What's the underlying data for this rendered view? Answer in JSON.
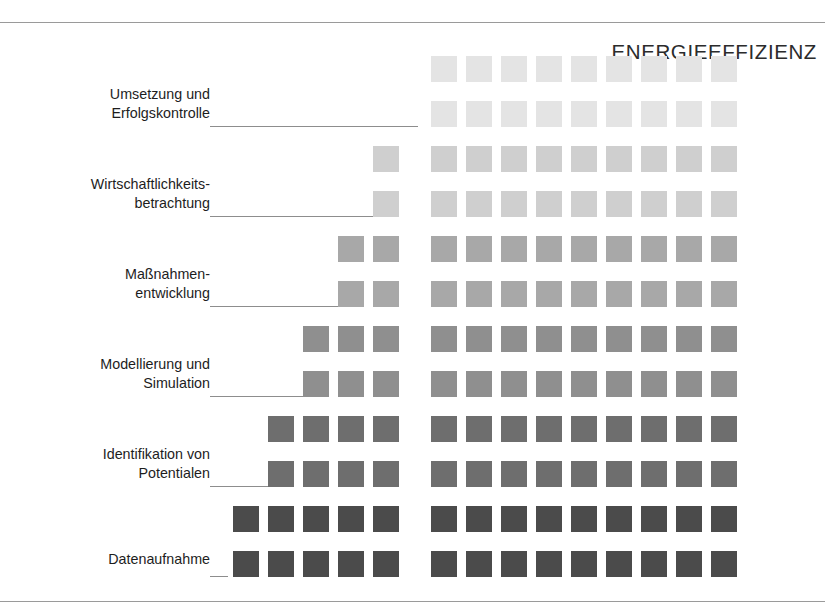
{
  "figure": {
    "heading": "ENERGIEEFFIZIENZ",
    "background": "#ffffff",
    "rule_color": "#9a9a9a",
    "leader_color": "#8d8d8d"
  },
  "stages": [
    {
      "id": "umsetzung-und-erfolgskontrolle",
      "line1": "Umsetzung und",
      "line2": "Erfolgskontrolle",
      "level": 6,
      "start_column": 6,
      "filled_columns": 9,
      "color": "#e4e4e4",
      "leader_length": 208
    },
    {
      "id": "wirtschaftlichkeitsbetrachtung",
      "line1": "Wirtschaftlichkeits-",
      "line2": "betrachtung",
      "level": 5,
      "start_column": 5,
      "filled_columns": 10,
      "color": "#cfcfcf",
      "leader_length": 182
    },
    {
      "id": "massnahmenentwicklung",
      "line1": "Maßnahmen-",
      "line2": "entwicklung",
      "level": 4,
      "start_column": 4,
      "filled_columns": 11,
      "color": "#a8a8a8",
      "leader_length": 147
    },
    {
      "id": "modellierung-und-simulation",
      "line1": "Modellierung und",
      "line2": "Simulation",
      "level": 3,
      "start_column": 3,
      "filled_columns": 12,
      "color": "#8f8f8f",
      "leader_length": 112
    },
    {
      "id": "identifikation-von-potentialen",
      "line1": "Identifikation von",
      "line2": "Potentialen",
      "level": 2,
      "start_column": 2,
      "filled_columns": 13,
      "color": "#6e6e6e",
      "leader_length": 60
    },
    {
      "id": "datenaufnahme",
      "line1": "Datenaufnahme",
      "line2": "",
      "level": 1,
      "start_column": 1,
      "filled_columns": 14,
      "color": "#4b4b4b",
      "leader_length": 18
    }
  ],
  "chart_data": {
    "type": "heatmap",
    "title": "ENERGIEEFFIZIENZ",
    "xlabel": "",
    "ylabel": "",
    "grid": false,
    "legend": "none",
    "columns": 14,
    "column_gap_after": 5,
    "rows_per_stage": 2,
    "categories": [
      "Datenaufnahme",
      "Identifikation von Potentialen",
      "Modellierung und Simulation",
      "Maßnahmenentwicklung",
      "Wirtschaftlichkeitsbetrachtung",
      "Umsetzung und Erfolgskontrolle"
    ],
    "values": [
      14,
      13,
      12,
      11,
      10,
      9
    ],
    "colors": [
      "#4b4b4b",
      "#6e6e6e",
      "#8f8f8f",
      "#a8a8a8",
      "#cfcfcf",
      "#e4e4e4"
    ]
  }
}
